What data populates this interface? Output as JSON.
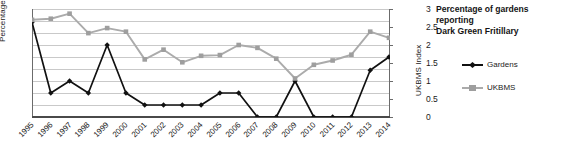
{
  "chart_data": {
    "type": "line",
    "title": "Percentage of gardens reporting Dark Green Fritillary",
    "title_line1": "Percentage of gardens reporting",
    "title_line2": "Dark Green Fritillary",
    "xlabel": "",
    "ylabel": "Percentage",
    "y2label": "UKBMS Index",
    "ylim": [
      0,
      9
    ],
    "y2lim": [
      0,
      3
    ],
    "yticks": [
      0,
      1,
      2,
      3,
      4,
      5,
      6,
      7,
      8,
      9
    ],
    "y2ticks": [
      "0",
      "0.5",
      "1",
      "1.5",
      "2",
      "2.5",
      "3"
    ],
    "grid": true,
    "legend_position": "right",
    "categories": [
      "1995",
      "1996",
      "1997",
      "1998",
      "1999",
      "2000",
      "2001",
      "2002",
      "2003",
      "2004",
      "2005",
      "2006",
      "2007",
      "2008",
      "2009",
      "2010",
      "2011",
      "2012",
      "2013",
      "2014"
    ],
    "series": [
      {
        "name": "Gardens",
        "axis": "left",
        "color": "#111111",
        "marker": "diamond",
        "values": [
          7.9,
          2.0,
          3.0,
          2.0,
          6.0,
          2.0,
          1.0,
          1.0,
          1.0,
          1.0,
          2.0,
          2.0,
          0.0,
          0.0,
          3.0,
          0.0,
          0.0,
          0.0,
          3.9,
          5.0
        ]
      },
      {
        "name": "UKBMS",
        "axis": "right",
        "color": "#ababab",
        "marker": "square",
        "values": [
          2.7,
          2.73,
          2.87,
          2.33,
          2.47,
          2.37,
          1.6,
          1.87,
          1.52,
          1.7,
          1.72,
          2.0,
          1.92,
          1.62,
          1.07,
          1.45,
          1.57,
          1.73,
          2.37,
          2.2
        ]
      }
    ]
  },
  "legend": {
    "items": [
      {
        "label": "Gardens",
        "color": "#111111"
      },
      {
        "label": "UKBMS",
        "color": "#ababab"
      }
    ]
  },
  "colors": {
    "gardens": "#111111",
    "ukbms": "#ababab",
    "gridline": "#c9c9c9",
    "axis": "#5a5a5a",
    "background": "#ffffff"
  }
}
